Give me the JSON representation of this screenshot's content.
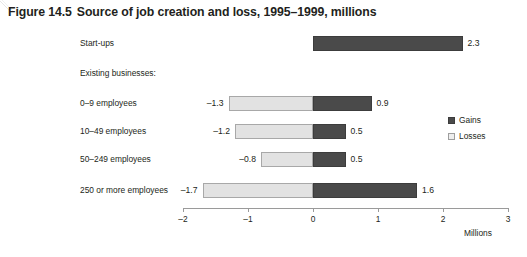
{
  "chart_data": {
    "type": "bar",
    "orientation": "horizontal",
    "stacked_diverging": true,
    "figure_number": "Figure 14.5",
    "title_text": "Source of job creation and loss, 1995–1999, millions",
    "xlabel": "Millions",
    "ylabel": "",
    "xlim": [
      -2,
      3
    ],
    "ticks": [
      "–2",
      "–1",
      "0",
      "1",
      "2",
      "3"
    ],
    "tick_values": [
      -2,
      -1,
      0,
      1,
      2,
      3
    ],
    "grid": false,
    "legend_position": "right",
    "categories": [
      "Start-ups",
      "Existing businesses:",
      "0–9 employees",
      "10–49 employees",
      "50–249 employees",
      "250 or more employees"
    ],
    "series": [
      {
        "name": "Gains",
        "color": "#4a4a4a",
        "values": [
          2.3,
          null,
          0.9,
          0.5,
          0.5,
          1.6
        ]
      },
      {
        "name": "Losses",
        "color": "#e2e2e2",
        "values": [
          null,
          null,
          -1.3,
          -1.2,
          -0.8,
          -1.7
        ]
      }
    ],
    "rows": [
      {
        "label": "Start-ups",
        "is_header": false,
        "gain": 2.3,
        "loss": null,
        "gain_label": "2.3",
        "loss_label": ""
      },
      {
        "label": "Existing businesses:",
        "is_header": true,
        "gain": null,
        "loss": null,
        "gain_label": "",
        "loss_label": ""
      },
      {
        "label": "0–9 employees",
        "is_header": false,
        "gain": 0.9,
        "loss": -1.3,
        "gain_label": "0.9",
        "loss_label": "–1.3"
      },
      {
        "label": "10–49 employees",
        "is_header": false,
        "gain": 0.5,
        "loss": -1.2,
        "gain_label": "0.5",
        "loss_label": "–1.2"
      },
      {
        "label": "50–249 employees",
        "is_header": false,
        "gain": 0.5,
        "loss": -0.8,
        "gain_label": "0.5",
        "loss_label": "–0.8"
      },
      {
        "label": "250 or more employees",
        "is_header": false,
        "gain": 1.6,
        "loss": -1.7,
        "gain_label": "1.6",
        "loss_label": "–1.7"
      }
    ],
    "legend": [
      {
        "label": "Gains",
        "color": "#4a4a4a"
      },
      {
        "label": "Losses",
        "color": "#e2e2e2"
      }
    ]
  },
  "colors": {
    "gains": "#4a4a4a",
    "losses": "#e2e2e2",
    "axis": "#9a9a9a",
    "text": "#231f20",
    "background": "#ffffff"
  }
}
